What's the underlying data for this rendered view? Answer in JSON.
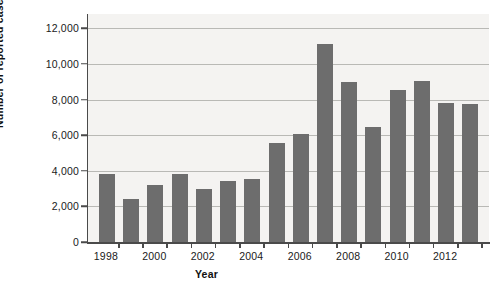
{
  "chart_data": {
    "type": "bar",
    "title": "",
    "xlabel": "Year",
    "ylabel": "Number of reported cases",
    "categories": [
      1998,
      1999,
      2000,
      2001,
      2002,
      2003,
      2004,
      2005,
      2006,
      2007,
      2008,
      2009,
      2010,
      2011,
      2012,
      2013
    ],
    "values": [
      3800,
      2400,
      3200,
      3800,
      3000,
      3450,
      3550,
      5550,
      6050,
      11100,
      9000,
      6450,
      8550,
      9050,
      7800,
      7750
    ],
    "xlim": [
      1997.4,
      2013.6
    ],
    "ylim": [
      0,
      12800
    ],
    "y_ticks": [
      0,
      2000,
      4000,
      6000,
      8000,
      10000,
      12000
    ],
    "y_tick_labels": [
      "0",
      "2,000",
      "4,000",
      "6,000",
      "8,000",
      "10,000",
      "12,000"
    ],
    "x_ticks": [
      1998,
      2000,
      2002,
      2004,
      2006,
      2008,
      2010,
      2012
    ],
    "x_tick_labels": [
      "1998",
      "2000",
      "2002",
      "2004",
      "2006",
      "2008",
      "2010",
      "2012"
    ],
    "grid": true,
    "legend": null,
    "bar_color": "#6d6d6d",
    "plot_background": "#f4f3f1",
    "gridline_color": "#b9b9b5",
    "axis_color": "#4a4a4a"
  }
}
